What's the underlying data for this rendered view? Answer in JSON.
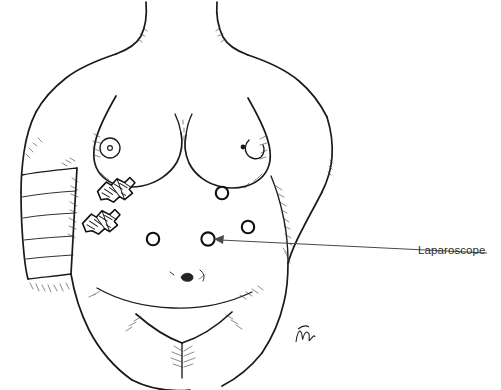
{
  "figure": {
    "type": "medical-line-illustration",
    "title_visible": false,
    "background_color": "#ffffff",
    "ink_color": "#1a1a1a",
    "canvas": {
      "width": 501,
      "height": 390
    }
  },
  "annotations": [
    {
      "id": "laparoscope",
      "label": "Laparoscope",
      "label_color": "#2e2e2e",
      "leader_from": {
        "x": 487,
        "y": 253
      },
      "leader_to": {
        "x": 214,
        "y": 239
      },
      "arrowhead": "left",
      "target": "port-site-laparoscope"
    }
  ],
  "port_sites": [
    {
      "id": "port-site-upper-mid",
      "name": "upper-midline-port",
      "cx": 222,
      "cy": 193,
      "r": 6.2
    },
    {
      "id": "port-site-right-lateral",
      "name": "right-lateral-port",
      "cx": 248,
      "cy": 227,
      "r": 6.2
    },
    {
      "id": "port-site-left-lower",
      "name": "left-lower-port",
      "cx": 153,
      "cy": 239,
      "r": 6.2
    },
    {
      "id": "port-site-laparoscope",
      "name": "laparoscope-port",
      "cx": 208,
      "cy": 239,
      "r": 6.6
    }
  ],
  "instruments": [
    {
      "id": "trocar-upper",
      "name": "trocar-instrument-upper",
      "x": 115,
      "y": 190,
      "rotation": -28
    },
    {
      "id": "trocar-lower",
      "name": "trocar-instrument-lower",
      "x": 100,
      "y": 222,
      "rotation": -28
    }
  ],
  "anatomy": {
    "neck": "neck-outline",
    "shoulders": "shoulder-contours",
    "breasts": "breast-contours-with-nipples",
    "left_arm": "bandaged-left-arm",
    "right_arm": "right-arm-contour",
    "abdomen": "abdominal-wall",
    "umbilicus": "navel-mark",
    "pubic_region": "lower-abdomen-v-contour"
  },
  "artist_signature": {
    "present": true,
    "x": 300,
    "y": 332
  }
}
